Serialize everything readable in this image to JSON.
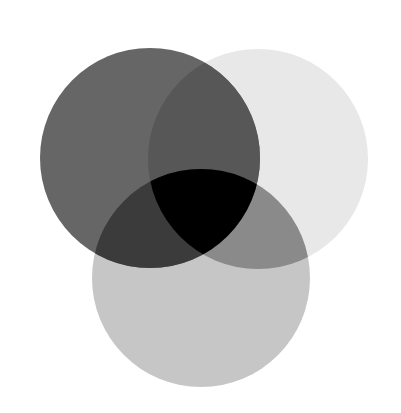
{
  "diagram": {
    "type": "venn",
    "sets": [
      {
        "id": "A",
        "position": "top-left",
        "cx": 150,
        "cy": 158,
        "r": 110,
        "color": "#666666"
      },
      {
        "id": "B",
        "position": "top-right",
        "cx": 258,
        "cy": 159,
        "r": 110,
        "color": "#e8e8e8"
      },
      {
        "id": "C",
        "position": "bottom",
        "cx": 201,
        "cy": 278,
        "r": 109,
        "color": "#c6c6c6"
      }
    ],
    "intersections": {
      "AB": "#575757",
      "AC": "#3b3b3b",
      "BC": "#8a8a8a",
      "ABC": "#000000"
    },
    "background": "#ffffff"
  }
}
